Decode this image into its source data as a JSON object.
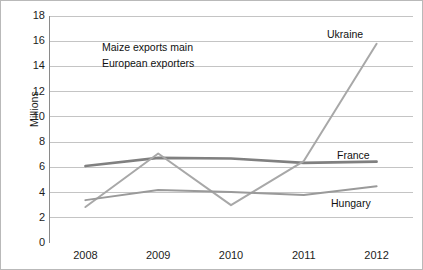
{
  "figure": {
    "ylabel": "Millions",
    "annotation": {
      "line1": "Maize exports main",
      "line2": "European exporters"
    }
  },
  "chart_data": {
    "type": "line",
    "title": "",
    "subtitle": "",
    "xlabel": "",
    "ylabel": "Millions",
    "categories": [
      "2008",
      "2009",
      "2010",
      "2011",
      "2012"
    ],
    "x": [
      2008,
      2009,
      2010,
      2011,
      2012
    ],
    "ylim": [
      0,
      18
    ],
    "yticks": [
      0,
      2,
      4,
      6,
      8,
      10,
      12,
      14,
      16,
      18
    ],
    "grid": "horizontal",
    "legend": "direct-labels",
    "annotations": [
      "Maize exports main",
      "European exporters"
    ],
    "series": [
      {
        "name": "France",
        "color": "#808080",
        "width": 2.6,
        "label_position": "right",
        "values": [
          6.1,
          6.75,
          6.7,
          6.35,
          6.45
        ]
      },
      {
        "name": "Ukraine",
        "color": "#a8a8a8",
        "width": 2.0,
        "label_position": "top-right",
        "values": [
          2.85,
          7.1,
          3.0,
          6.5,
          15.8
        ]
      },
      {
        "name": "Hungary",
        "color": "#9a9a9a",
        "width": 2.0,
        "label_position": "bottom-right",
        "values": [
          3.4,
          4.2,
          4.05,
          3.8,
          4.5
        ]
      }
    ]
  }
}
